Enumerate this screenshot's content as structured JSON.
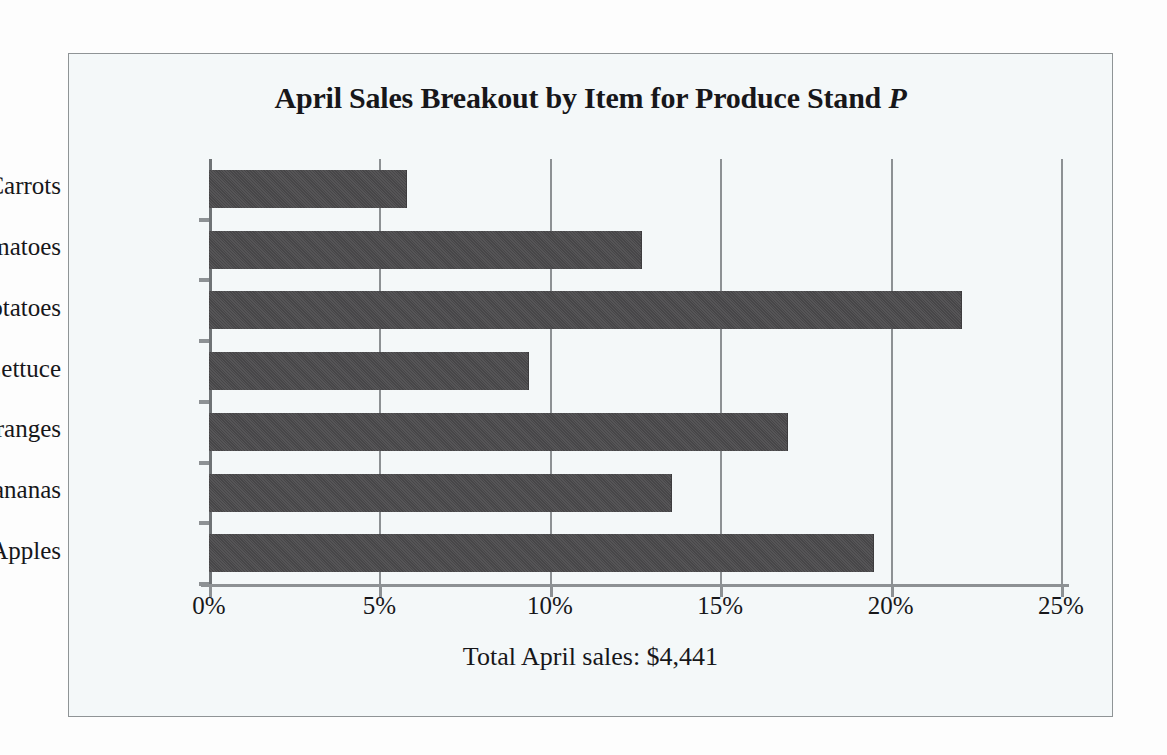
{
  "figure": {
    "border_color": "#8f9496",
    "background_color": "#f4f8f9"
  },
  "chart_data": {
    "type": "bar",
    "orientation": "horizontal",
    "title": "April Sales Breakout by Item for Produce Stand ",
    "title_italic_suffix": "P",
    "title_full": "April Sales Breakout by Item for Produce Stand P",
    "caption": "Total April sales: $4,441",
    "categories": [
      "Carrots",
      "Tomatoes",
      "Potatoes",
      "Lettuce",
      "Oranges",
      "Bananas",
      "Apples"
    ],
    "values": [
      5.8,
      12.7,
      22.1,
      9.4,
      17.0,
      13.6,
      19.5
    ],
    "value_unit": "%",
    "xlabel": "",
    "ylabel": "",
    "xlim": [
      0,
      25
    ],
    "xticks": [
      0,
      5,
      10,
      15,
      20,
      25
    ],
    "xtick_labels": [
      "0%",
      "5%",
      "10%",
      "15%",
      "20%",
      "25%"
    ],
    "grid": "vertical",
    "legend": "none",
    "bar_color": "#4b4a4c",
    "axis_color": "#8d9194",
    "text_color": "#17171a"
  }
}
